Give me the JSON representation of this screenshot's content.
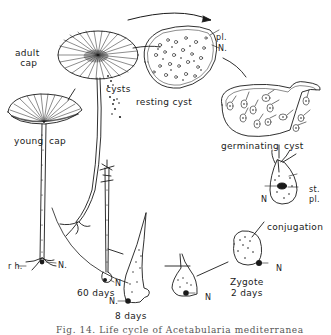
{
  "figure": {
    "title": "Life cycle of Acetabularia",
    "caption": "Fig. 14. Life cycle of Acetabularia mediterranea",
    "stroke_color": "#1a1a1a",
    "background": "#ffffff"
  },
  "labels": {
    "adult_cap_line1": "adult",
    "adult_cap_line2": "cap",
    "young_cap_word1": "young",
    "young_cap_word2": "cap",
    "cysts": "cysts",
    "resting_cyst": "resting cyst",
    "pl_resting": "pl.",
    "n_resting": "N.",
    "germinating_word1": "germinating",
    "germinating_word2": "cyst",
    "st": "st.",
    "pl_conj": "pl.",
    "n_conj": "N",
    "conjugation": "conjugation",
    "zygote_line1": "Zygote",
    "zygote_line2": "2 days",
    "n_zygote": "N",
    "n_8days_a": "N",
    "n_8days_b": "N.",
    "eight_days": "8 days",
    "n_60days": "N",
    "sixty_days": "60 days",
    "rh": "r h.",
    "n_young": "N."
  },
  "stages": [
    {
      "name": "adult cap"
    },
    {
      "name": "cysts"
    },
    {
      "name": "resting cyst"
    },
    {
      "name": "germinating cyst"
    },
    {
      "name": "conjugation"
    },
    {
      "name": "Zygote 2 days"
    },
    {
      "name": "8 days"
    },
    {
      "name": "60 days"
    },
    {
      "name": "young cap"
    }
  ]
}
